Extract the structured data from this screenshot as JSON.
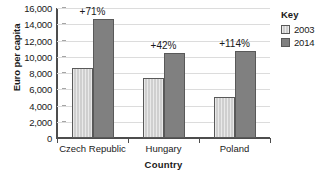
{
  "chart_data": {
    "type": "bar",
    "title": "",
    "xlabel": "Country",
    "ylabel": "Euro per capita",
    "categories": [
      "Czech Republic",
      "Hungary",
      "Poland"
    ],
    "series": [
      {
        "name": "2003",
        "values": [
          8600,
          7400,
          5000
        ],
        "color": "#cfcfcf"
      },
      {
        "name": "2014",
        "values": [
          14700,
          10500,
          10700
        ],
        "color": "#808080"
      }
    ],
    "annotations": [
      "+71%",
      "+42%",
      "+114%"
    ],
    "ylim": [
      0,
      16000
    ],
    "ytick_values": [
      0,
      2000,
      4000,
      6000,
      8000,
      10000,
      12000,
      14000,
      16000
    ],
    "ytick_labels": [
      "0",
      "2,000",
      "4,000",
      "6,000",
      "8,000",
      "10,000",
      "12,000",
      "14,000",
      "16,000"
    ],
    "grid": true,
    "legend_position": "right",
    "legend_title": "Key"
  },
  "legend": {
    "title": "Key",
    "entries": [
      {
        "label": "2003"
      },
      {
        "label": "2014"
      }
    ]
  },
  "axes": {
    "x_title": "Country",
    "y_title": "Euro per capita"
  }
}
